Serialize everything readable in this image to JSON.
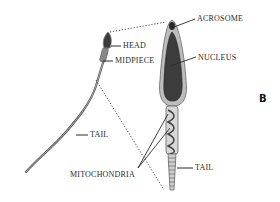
{
  "figure": {
    "panel_letter": "B",
    "labels": {
      "head": "HEAD",
      "midpiece": "MIDPIECE",
      "tail_left": "TAIL",
      "acrosome": "ACROSOME",
      "nucleus": "NUCLEUS",
      "mitochondria": "MITOCHONDRIA",
      "tail_right": "TAIL"
    },
    "colors": {
      "line": "#2a2a2a",
      "head_fill": "#3a3a3a",
      "membrane": "#c8c8c8",
      "nucleus_fill": "#4a4a4a"
    }
  }
}
